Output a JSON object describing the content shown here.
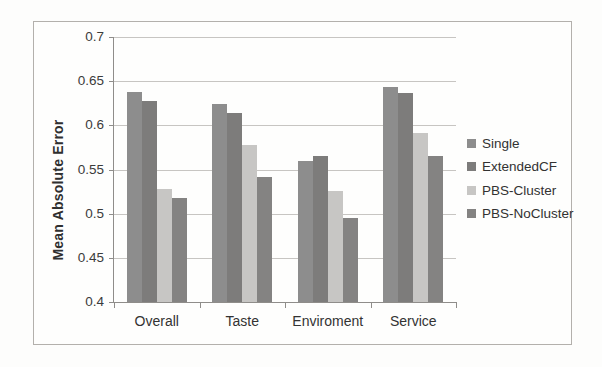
{
  "chart_data": {
    "type": "bar",
    "title": "",
    "xlabel": "",
    "ylabel": "Mean Absolute Error",
    "categories": [
      "Overall",
      "Taste",
      "Enviroment",
      "Service"
    ],
    "series": [
      {
        "name": "Single",
        "color": "#8d8d8d",
        "values": [
          0.638,
          0.624,
          0.56,
          0.643
        ]
      },
      {
        "name": "ExtendedCF",
        "color": "#7d7c7b",
        "values": [
          0.627,
          0.614,
          0.565,
          0.637
        ]
      },
      {
        "name": "PBS-Cluster",
        "color": "#c7c6c4",
        "values": [
          0.528,
          0.578,
          0.526,
          0.591
        ]
      },
      {
        "name": "PBS-NoCluster",
        "color": "#848382",
        "values": [
          0.518,
          0.542,
          0.495,
          0.565
        ]
      }
    ],
    "ylim": [
      0.4,
      0.7
    ],
    "yticks": [
      0.4,
      0.45,
      0.5,
      0.55,
      0.6,
      0.65,
      0.7
    ],
    "grid": true,
    "legend_position": "right"
  },
  "style_colors": {
    "gridline": "#c7c5c2",
    "axis": "#8f8d8a",
    "frame_border": "#b3b0ac",
    "text": "#333333"
  }
}
